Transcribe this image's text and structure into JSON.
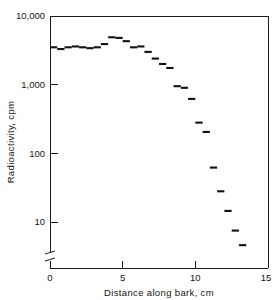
{
  "chart_data": {
    "type": "scatter",
    "title": "",
    "xlabel": "Distance along bark, cm",
    "ylabel": "Radioactivity, cpm",
    "yscale": "log",
    "xscale": "linear",
    "xlim": [
      0,
      15
    ],
    "ylim": [
      4,
      10000
    ],
    "grid": false,
    "legend": null,
    "axis_break": {
      "axis": "y",
      "note": "break symbol on y-axis below the 10 tick"
    },
    "xticks": [
      0,
      5,
      10,
      15
    ],
    "xtick_labels": [
      "0",
      "5",
      "10",
      "15"
    ],
    "yticks": [
      10,
      100,
      1000,
      10000
    ],
    "ytick_labels": [
      "10",
      "100",
      "1,000",
      "10,000"
    ],
    "marker_style": "horizontal-dash",
    "bin_width_cm": 0.5,
    "x": [
      0.25,
      0.75,
      1.25,
      1.75,
      2.25,
      2.75,
      3.25,
      3.75,
      4.25,
      4.75,
      5.25,
      5.75,
      6.25,
      6.75,
      7.25,
      7.75,
      8.25,
      8.75,
      9.25,
      9.75,
      10.25,
      10.75,
      11.25,
      11.75,
      12.25,
      12.75,
      13.25
    ],
    "values": [
      3500,
      3300,
      3500,
      3600,
      3500,
      3400,
      3500,
      3900,
      4900,
      4800,
      4300,
      3500,
      3600,
      3000,
      2400,
      2000,
      1750,
      950,
      900,
      620,
      280,
      205,
      62,
      28,
      14.5,
      7.5,
      4.6
    ],
    "series": [
      {
        "name": "Radioactivity",
        "values": [
          3500,
          3300,
          3500,
          3600,
          3500,
          3400,
          3500,
          3900,
          4900,
          4800,
          4300,
          3500,
          3600,
          3000,
          2400,
          2000,
          1750,
          950,
          900,
          620,
          280,
          205,
          62,
          28,
          14.5,
          7.5,
          4.6
        ]
      }
    ]
  },
  "figure": {
    "xlabel": "Distance along bark, cm",
    "ylabel": "Radioactivity, cpm"
  }
}
